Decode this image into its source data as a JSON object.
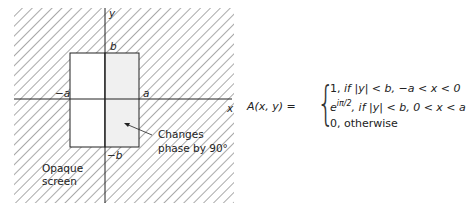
{
  "figure": {
    "axes": {
      "x_label": "x",
      "y_label": "y"
    },
    "ticks": {
      "a_pos": "a",
      "a_neg": "−a",
      "b_pos": "b",
      "b_neg": "−b"
    },
    "annotations": {
      "phase_line1": "Changes",
      "phase_line2": "phase by 90°",
      "screen_line1": "Opaque",
      "screen_line2": "screen"
    }
  },
  "equation": {
    "lhs": "A(x, y) =",
    "cases": [
      {
        "value": "1,",
        "condition": "if |y| < b, −a < x < 0"
      },
      {
        "value": "e",
        "exponent": "iπ/2",
        "condition": ", if |y| < b, 0 < x < a"
      },
      {
        "value": "0,",
        "condition": "otherwise"
      }
    ]
  }
}
